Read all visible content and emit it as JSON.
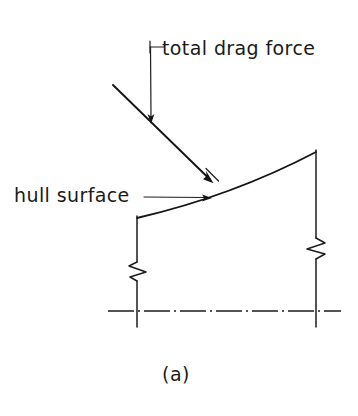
{
  "figure": {
    "caption": "(a)",
    "background_color": "#ffffff",
    "ink_color": "#1a1a1a",
    "labels": {
      "drag_force": "total drag force",
      "hull_surface": "hull surface"
    },
    "annotations": [
      {
        "name": "total-drag-force",
        "text": "total drag force",
        "text_x": 162,
        "text_baseline_y": 55,
        "leader": {
          "type": "elbow",
          "horizontal_from_x": 150,
          "horizontal_to_x": 163,
          "horizontal_y": 47,
          "vertical_from_y": 41,
          "vertical_to_y": 118,
          "vertical_x": 150,
          "arrow_tip_x": 151,
          "arrow_tip_y": 123,
          "arrow_direction": "down"
        }
      },
      {
        "name": "hull-surface",
        "text": "hull surface",
        "text_x": 14,
        "text_baseline_y": 202,
        "leader": {
          "type": "straight",
          "from_x": 144,
          "to_x": 210,
          "y": 197,
          "arrow_tip_x": 212,
          "arrow_tip_y": 197,
          "arrow_direction": "right"
        }
      }
    ],
    "geometry": {
      "drag_force_vector": {
        "name": "total-drag-force-vector",
        "start_x": 113,
        "start_y": 85,
        "end_x": 213,
        "end_y": 183,
        "has_arrowhead": true,
        "has_perpendicular_tick": true
      },
      "hull_curve": {
        "name": "hull-surface-curve",
        "start_x": 137,
        "start_y": 218,
        "control_x": 232,
        "control_y": 196,
        "end_x": 316,
        "end_y": 152,
        "shape": "concave-down-arc"
      },
      "left_vertical": {
        "name": "left-station-line",
        "x": 137,
        "top_y": 218,
        "bottom_y": 327,
        "break_symbol_y": 268
      },
      "right_vertical": {
        "name": "right-station-line",
        "x": 316,
        "top_y": 150,
        "bottom_y": 327,
        "break_symbol_y": 246
      },
      "baseline": {
        "name": "waterline-baseline",
        "from_x": 108,
        "to_x": 341,
        "y": 311,
        "style": "dash-dot"
      }
    },
    "caption_x": 176,
    "caption_baseline_y": 381
  }
}
